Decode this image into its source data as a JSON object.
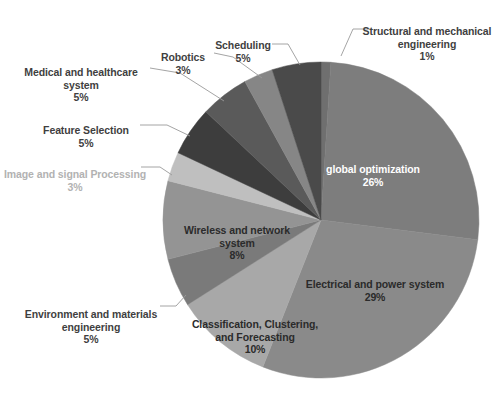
{
  "chart_data": {
    "type": "pie",
    "title": "",
    "xlabel": "",
    "ylabel": "",
    "legend_position": "none",
    "grid": false,
    "label_format": "name + percentage",
    "start_angle_deg": 0,
    "direction": "clockwise",
    "categories": [
      "Structural and mechanical engineering",
      "global optimization",
      "Electrical and power system",
      "Classification, Clustering, and Forecasting",
      "Environment and materials engineering",
      "Wireless and network system",
      "Image and signal Processing",
      "Feature Selection",
      "Medical and healthcare system",
      "Robotics",
      "Scheduling"
    ],
    "values": [
      1,
      26,
      29,
      10,
      5,
      8,
      3,
      5,
      5,
      3,
      5
    ],
    "percent_labels": [
      "1%",
      "26%",
      "29%",
      "10%",
      "5%",
      "8%",
      "3%",
      "5%",
      "5%",
      "3%",
      "5%"
    ],
    "colors": [
      "#6f6f6f",
      "#7d7d7d",
      "#8a8a8a",
      "#a8a8a8",
      "#7a7a7a",
      "#949494",
      "#bfbfbf",
      "#3d3d3d",
      "#5a5a5a",
      "#868686",
      "#4a4a4a"
    ],
    "slices": [
      {
        "name": "Structural and mechanical engineering",
        "value": 1,
        "percent_label": "1%",
        "color": "#6f6f6f",
        "label_placement": "outside",
        "label_text_color": "#3f3f3f",
        "leader_line": true
      },
      {
        "name": "global optimization",
        "value": 26,
        "percent_label": "26%",
        "color": "#7d7d7d",
        "label_placement": "inside",
        "label_text_color": "#ffffff",
        "leader_line": false
      },
      {
        "name": "Electrical and power system",
        "value": 29,
        "percent_label": "29%",
        "color": "#8a8a8a",
        "label_placement": "inside",
        "label_text_color": "#2b2b2b",
        "leader_line": false
      },
      {
        "name": "Classification, Clustering, and Forecasting",
        "value": 10,
        "percent_label": "10%",
        "color": "#a8a8a8",
        "label_placement": "inside",
        "label_text_color": "#2b2b2b",
        "leader_line": false
      },
      {
        "name": "Environment and materials engineering",
        "value": 5,
        "percent_label": "5%",
        "color": "#7a7a7a",
        "label_placement": "outside",
        "label_text_color": "#3f3f3f",
        "leader_line": true
      },
      {
        "name": "Wireless and network system",
        "value": 8,
        "percent_label": "8%",
        "color": "#949494",
        "label_placement": "inside",
        "label_text_color": "#2b2b2b",
        "leader_line": false
      },
      {
        "name": "Image and signal Processing",
        "value": 3,
        "percent_label": "3%",
        "color": "#bfbfbf",
        "label_placement": "outside",
        "label_text_color": "#b2b2b2",
        "leader_line": true
      },
      {
        "name": "Feature Selection",
        "value": 5,
        "percent_label": "5%",
        "color": "#3d3d3d",
        "label_placement": "outside",
        "label_text_color": "#3f3f3f",
        "leader_line": true
      },
      {
        "name": "Medical and healthcare system",
        "value": 5,
        "percent_label": "5%",
        "color": "#5a5a5a",
        "label_placement": "outside",
        "label_text_color": "#3f3f3f",
        "leader_line": true
      },
      {
        "name": "Robotics",
        "value": 3,
        "percent_label": "3%",
        "color": "#868686",
        "label_placement": "outside",
        "label_text_color": "#3f3f3f",
        "leader_line": true
      },
      {
        "name": "Scheduling",
        "value": 5,
        "percent_label": "5%",
        "color": "#4a4a4a",
        "label_placement": "outside",
        "label_text_color": "#3f3f3f",
        "leader_line": true
      }
    ]
  },
  "labels": {
    "structural": {
      "name": "Structural and mechanical\nengineering",
      "pct": "1%"
    },
    "scheduling": {
      "name": "Scheduling",
      "pct": "5%"
    },
    "robotics": {
      "name": "Robotics",
      "pct": "3%"
    },
    "medical": {
      "name": "Medical and healthcare\nsystem",
      "pct": "5%"
    },
    "feature_selection": {
      "name": "Feature Selection",
      "pct": "5%"
    },
    "image_signal": {
      "name": "Image and signal Processing",
      "pct": "3%"
    },
    "environment": {
      "name": "Environment and materials\nengineering",
      "pct": "5%"
    },
    "classification": {
      "name": "Classification, Clustering,\nand Forecasting",
      "pct": "10%"
    },
    "wireless": {
      "name": "Wireless and network\nsystem",
      "pct": "8%"
    },
    "global_optimization": {
      "name": "global optimization",
      "pct": "26%"
    },
    "electrical": {
      "name": "Electrical and power system",
      "pct": "29%"
    }
  }
}
